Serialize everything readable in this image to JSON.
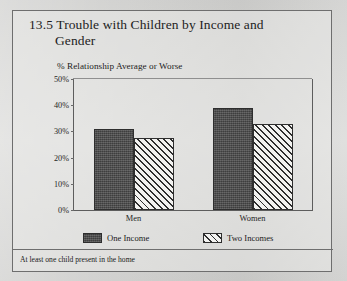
{
  "figure": {
    "title_number": "13.5",
    "title_line1": "13.5 Trouble with Children by Income and",
    "title_line2": "Gender",
    "subtitle": "% Relationship Average or Worse",
    "footnote": "At least one child present in the home",
    "frame_color": "#6e6e6e",
    "page_background": "#d8d8d6"
  },
  "chart_data": {
    "type": "bar",
    "title": "13.5 Trouble with Children by Income and Gender",
    "subtitle": "% Relationship Average or Worse",
    "xlabel": "",
    "ylabel": "% Relationship Average or Worse",
    "categories": [
      "Men",
      "Women"
    ],
    "series": [
      {
        "name": "One Income",
        "values": [
          31,
          39
        ],
        "fill": "solid",
        "color": "#4a4a4a"
      },
      {
        "name": "Two Incomes",
        "values": [
          27.5,
          33
        ],
        "fill": "diagonal-hatch",
        "color": "#f2f2f0"
      }
    ],
    "ylim": [
      0,
      50
    ],
    "ytick_labels": [
      "0%",
      "10%",
      "20%",
      "30%",
      "40%",
      "50%"
    ],
    "ytick_values": [
      0,
      10,
      20,
      30,
      40,
      50
    ],
    "grid": false,
    "legend_position": "bottom",
    "note": "At least one child present in the home"
  }
}
